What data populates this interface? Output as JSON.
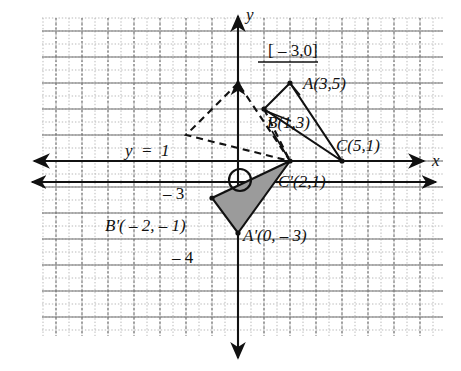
{
  "figure": {
    "type": "coordinate-geometry-diagram",
    "axis_labels": {
      "x": "x",
      "y": "y"
    },
    "grid": {
      "major_spacing_px": 26,
      "minor_per_major": 2,
      "origin_px": {
        "x": 238,
        "y": 161
      },
      "x_range": [
        -8,
        8
      ],
      "y_range": [
        -6,
        6
      ]
    },
    "annotations": {
      "translation_vector": "[ – 3,0]",
      "line_of_reflection": "y  =  1",
      "tick_neg3": "– 3",
      "tick_neg4": "– 4"
    },
    "points": [
      {
        "name": "A",
        "label": "A(3,5)",
        "coord": [
          3,
          5
        ],
        "px": [
          290,
          83
        ],
        "dot": true
      },
      {
        "name": "B",
        "label": "B(1,3)",
        "coord": [
          1,
          3
        ],
        "px": [
          264,
          109
        ],
        "dot": true
      },
      {
        "name": "C",
        "label": "C(5,1)",
        "coord": [
          5,
          1
        ],
        "px": [
          342,
          161
        ],
        "dot": true
      },
      {
        "name": "Cp",
        "label": "C'(2,1)",
        "coord": [
          2,
          1
        ],
        "px": [
          290,
          161
        ],
        "dot": true
      },
      {
        "name": "Bp",
        "label": "B'( – 2, – 1)",
        "coord": [
          -2,
          -1
        ],
        "px": [
          212,
          198
        ],
        "dot": true
      },
      {
        "name": "Ap",
        "label": "A'(0, – 3)",
        "coord": [
          0,
          -3
        ],
        "px": [
          238,
          233
        ],
        "dot": true
      }
    ],
    "shapes": {
      "triangle_solid_original": {
        "vertices_px": [
          [
            290,
            83
          ],
          [
            264,
            109
          ],
          [
            342,
            161
          ]
        ],
        "style": "solid",
        "fill": "none"
      },
      "triangle_dashed_intermediate": {
        "vertices_px": [
          [
            238,
            83
          ],
          [
            186,
            135
          ],
          [
            290,
            161
          ]
        ],
        "style": "dashed",
        "fill": "none"
      },
      "triangle_shaded_image": {
        "vertices_px": [
          [
            290,
            161
          ],
          [
            212,
            198
          ],
          [
            238,
            233
          ]
        ],
        "style": "solid",
        "fill": "#9a9a9a"
      }
    },
    "marker_circle": {
      "px": [
        240,
        180
      ],
      "radius": 11
    },
    "horizontal_lines": [
      {
        "name": "x-axis",
        "y_px": 161
      },
      {
        "name": "y-equals-minus-one-line",
        "y_px": 182
      }
    ],
    "colors": {
      "ink": "#111111",
      "grid_major": "#6f6f6f",
      "grid_minor": "#b9b9b9",
      "shade_fill": "#9b9b9b"
    }
  }
}
